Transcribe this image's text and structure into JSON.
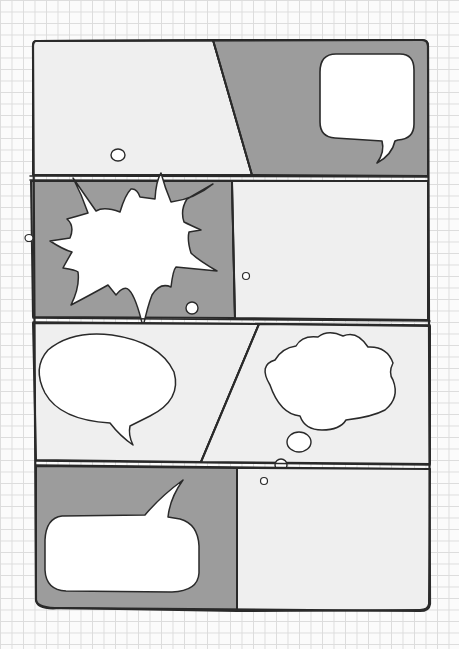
{
  "page": {
    "background": "graph paper grid",
    "colors": {
      "paper": "#fbfbfb",
      "grid": "#dcdcdc",
      "panel_light": "#efefef",
      "panel_grey": "#9c9c9c",
      "ink": "#2a2a2a",
      "bubble": "#ffffff"
    }
  },
  "rows": [
    {
      "id": 1,
      "panels": [
        {
          "name": "panel-1-left",
          "shade": "light",
          "elements": [
            "small-thought-dot"
          ]
        },
        {
          "name": "panel-1-right",
          "shade": "grey",
          "elements": [
            "rounded-speech-bubble-tail-down"
          ]
        }
      ],
      "divider": "diagonal"
    },
    {
      "id": 2,
      "panels": [
        {
          "name": "panel-2-left",
          "shade": "grey",
          "elements": [
            "explosion-burst-bubble",
            "small-dot"
          ]
        },
        {
          "name": "panel-2-right",
          "shade": "light",
          "elements": [
            "tiny-dot"
          ]
        }
      ],
      "divider": "vertical"
    },
    {
      "id": 3,
      "panels": [
        {
          "name": "panel-3-left",
          "shade": "light",
          "elements": [
            "oval-speech-bubble-tail-down"
          ]
        },
        {
          "name": "panel-3-right",
          "shade": "light",
          "elements": [
            "cloud-thought-bubble",
            "thought-dots"
          ]
        }
      ],
      "divider": "diagonal"
    },
    {
      "id": 4,
      "panels": [
        {
          "name": "panel-4-left",
          "shade": "grey",
          "elements": [
            "rectangular-speech-bubble-tail-up"
          ]
        },
        {
          "name": "panel-4-right",
          "shade": "light",
          "elements": [
            "tiny-dot"
          ]
        }
      ],
      "divider": "vertical"
    }
  ]
}
